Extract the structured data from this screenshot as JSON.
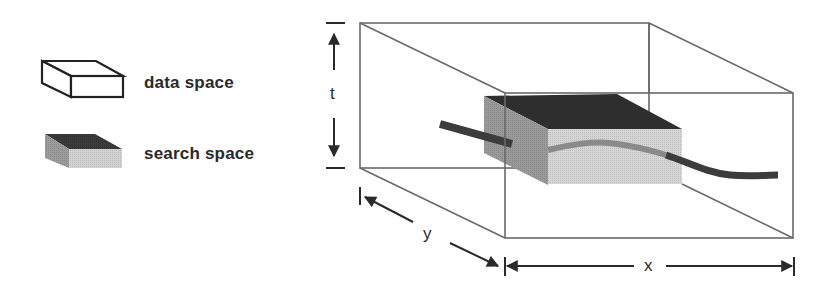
{
  "legend": {
    "items": [
      {
        "label": "data space",
        "icon": "outlined-box-icon"
      },
      {
        "label": "search space",
        "icon": "shaded-box-icon"
      }
    ]
  },
  "axes": {
    "t": "t",
    "y": "y",
    "x": "x"
  },
  "colors": {
    "outline": "#3a3a3a",
    "box_edge": "#6a6a6a",
    "search_top": "#2e2e2e",
    "search_left": "#9a9a9a",
    "search_front": "#d6d6d6",
    "trajectory_dark": "#3c3c3c",
    "trajectory_inside": "#8a8a8a"
  }
}
